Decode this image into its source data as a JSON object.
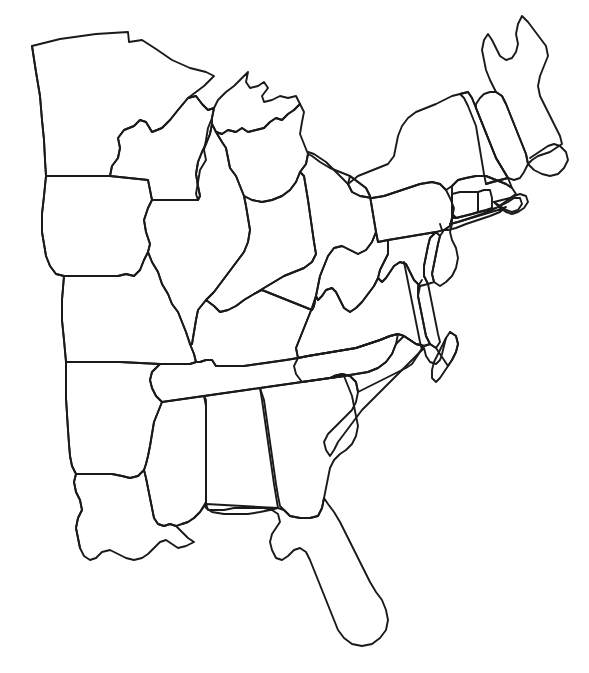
{
  "figure": {
    "kind": "outline-map",
    "title": "Eastern United States Blank Outline Map",
    "caption": "",
    "labels_shown": "none",
    "legend_shown": "none",
    "background_color": "#ffffff",
    "outline_color": "#1a1a1a",
    "fill_color": "#ffffff",
    "stroke_width_px": 1.9,
    "width_px": 589,
    "height_px": 673,
    "style": "hand-drawn line art",
    "region": "Eastern and Midwestern United States",
    "projection_note": "unlabeled outline; western states cropped at a straight vertical edge"
  },
  "map_data": {
    "type": "outline-map",
    "label_text_present": false,
    "state_count": 26,
    "states": [
      {
        "name": "Minnesota",
        "abbr": "MN",
        "labeled": false
      },
      {
        "name": "Wisconsin",
        "abbr": "WI",
        "labeled": false
      },
      {
        "name": "Michigan",
        "abbr": "MI",
        "labeled": false
      },
      {
        "name": "Iowa",
        "abbr": "IA",
        "labeled": false
      },
      {
        "name": "Illinois",
        "abbr": "IL",
        "labeled": false
      },
      {
        "name": "Indiana",
        "abbr": "IN",
        "labeled": false
      },
      {
        "name": "Ohio",
        "abbr": "OH",
        "labeled": false
      },
      {
        "name": "Missouri",
        "abbr": "MO",
        "labeled": false
      },
      {
        "name": "Kentucky",
        "abbr": "KY",
        "labeled": false
      },
      {
        "name": "Tennessee",
        "abbr": "TN",
        "labeled": false
      },
      {
        "name": "Arkansas",
        "abbr": "AR",
        "labeled": false
      },
      {
        "name": "Louisiana",
        "abbr": "LA",
        "labeled": false
      },
      {
        "name": "Mississippi",
        "abbr": "MS",
        "labeled": false
      },
      {
        "name": "Alabama",
        "abbr": "AL",
        "labeled": false
      },
      {
        "name": "Georgia",
        "abbr": "GA",
        "labeled": false
      },
      {
        "name": "Florida",
        "abbr": "FL",
        "labeled": false
      },
      {
        "name": "South Carolina",
        "abbr": "SC",
        "labeled": false
      },
      {
        "name": "North Carolina",
        "abbr": "NC",
        "labeled": false
      },
      {
        "name": "Virginia",
        "abbr": "VA",
        "labeled": false
      },
      {
        "name": "West Virginia",
        "abbr": "WV",
        "labeled": false
      },
      {
        "name": "Maryland",
        "abbr": "MD",
        "labeled": false
      },
      {
        "name": "Delaware",
        "abbr": "DE",
        "labeled": false
      },
      {
        "name": "Pennsylvania",
        "abbr": "PA",
        "labeled": false
      },
      {
        "name": "New Jersey",
        "abbr": "NJ",
        "labeled": false
      },
      {
        "name": "New York",
        "abbr": "NY",
        "labeled": false
      },
      {
        "name": "Connecticut",
        "abbr": "CT",
        "labeled": false
      },
      {
        "name": "Rhode Island",
        "abbr": "RI",
        "labeled": false
      },
      {
        "name": "Massachusetts",
        "abbr": "MA",
        "labeled": false
      },
      {
        "name": "Vermont",
        "abbr": "VT",
        "labeled": false
      },
      {
        "name": "New Hampshire",
        "abbr": "NH",
        "labeled": false
      },
      {
        "name": "Maine",
        "abbr": "ME",
        "labeled": false
      }
    ],
    "features": [
      "Great Lakes shoreline (Superior, Michigan, Huron, Erie, Ontario)",
      "Michigan Upper Peninsula",
      "Michigan Lower Peninsula",
      "Minnesota Northwest Angle",
      "Mississippi River delta (bird's foot)",
      "Florida peninsula and panhandle",
      "Chesapeake Bay and Delmarva Peninsula",
      "Cape Cod",
      "Outer Banks of North Carolina",
      "Long Island Sound coastline"
    ]
  }
}
